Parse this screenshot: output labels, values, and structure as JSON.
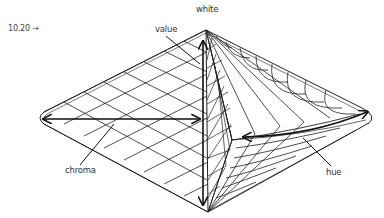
{
  "figure": {
    "number_label": "10.20 →"
  },
  "labels": {
    "value": "value",
    "white": "white",
    "chroma": "chroma",
    "hue": "hue"
  },
  "colors": {
    "line": "#1a1a1a",
    "text": "#333333",
    "background": "#ffffff"
  }
}
